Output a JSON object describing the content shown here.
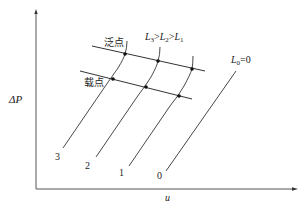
{
  "diagram": {
    "axes": {
      "y_label": "ΔP",
      "x_label": "u"
    },
    "lines": {
      "flooding_label": "泛点",
      "loading_label": "载点"
    },
    "annotation_order": {
      "L_a": "L",
      "sub_a": "3",
      "gt1": ">",
      "L_b": "L",
      "sub_b": "2",
      "gt2": ">",
      "L_c": "L",
      "sub_c": "1"
    },
    "annotation_dry": {
      "L": "L",
      "sub": "0",
      "eq": "=0"
    },
    "curve_labels": [
      "3",
      "2",
      "1",
      "0"
    ],
    "colors": {
      "line": "#333333",
      "axis": "#555555",
      "dot": "#111111"
    }
  }
}
